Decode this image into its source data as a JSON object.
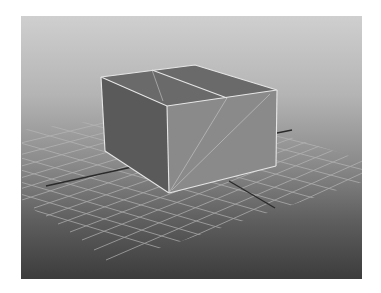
{
  "viewport": {
    "label": "3D perspective viewport",
    "background": {
      "top": "#cfcfcf",
      "bottom": "#3c3c3c"
    }
  },
  "scene": {
    "object": "box",
    "colors": {
      "top_face": "#6a6a6a",
      "left_face": "#5a5a5a",
      "front_face": "#8a8a8a",
      "edge": "#e6e6e6",
      "grid_line": "#b8b8b8",
      "axis_line": "#2a2a2a"
    }
  }
}
